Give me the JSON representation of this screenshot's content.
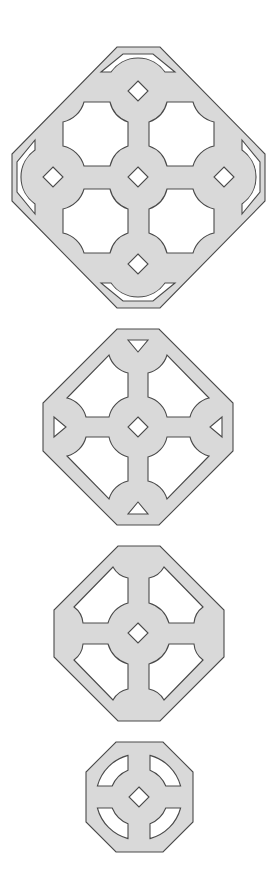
{
  "diagram": {
    "background": "#ffffff",
    "fill_color": "#d9d9d9",
    "stroke_color": "#4a4a4a",
    "figures": [
      {
        "id": "figure-1",
        "label": "Large diamond-oriented octagon with four cusped windows, five diamond holes and four crescent slits",
        "outline": "octagon",
        "windows": 4,
        "diamond_holes": 5,
        "crescent_slits": 4
      },
      {
        "id": "figure-2",
        "label": "Octagon with four cusped windows, one central diamond and four triangular holes",
        "outline": "octagon",
        "windows": 4,
        "diamond_holes": 1,
        "triangle_holes": 4
      },
      {
        "id": "figure-3",
        "label": "Octagon with four cusped windows and one central diamond",
        "outline": "octagon",
        "windows": 4,
        "diamond_holes": 1
      },
      {
        "id": "figure-4",
        "label": "Small octagon with four curved ring slots and one central diamond",
        "outline": "octagon",
        "ring_slots": 4,
        "diamond_holes": 1
      }
    ]
  }
}
